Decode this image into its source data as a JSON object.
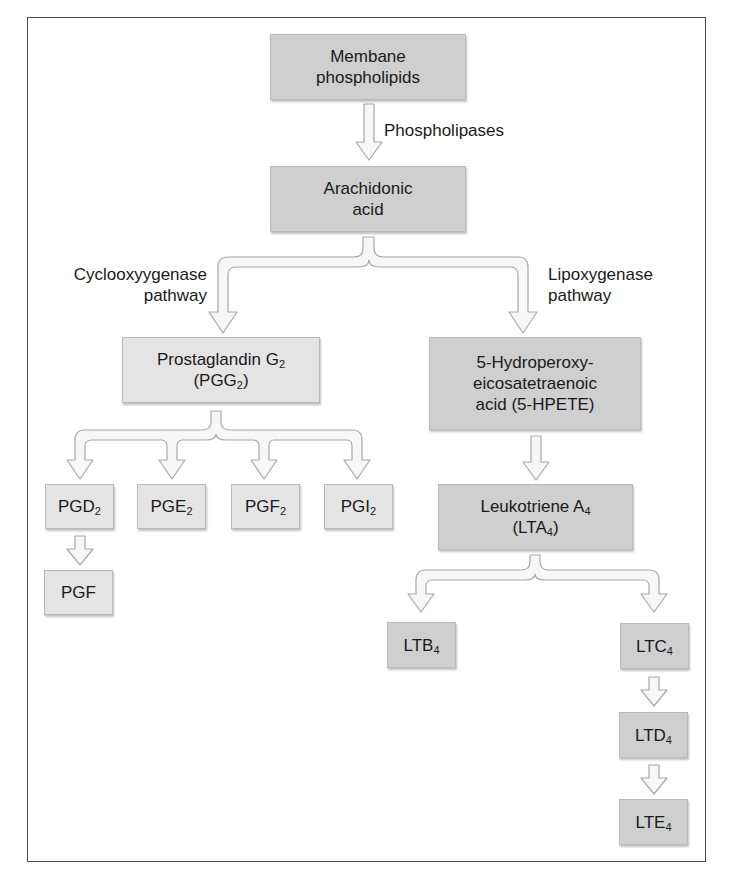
{
  "diagram": {
    "nodes": {
      "membrane": {
        "line1": "Membane",
        "line2": "phospholipids"
      },
      "arachidonic": {
        "line1": "Arachidonic",
        "line2": "acid"
      },
      "pgg2": {
        "line1_main": "Prostaglandin G",
        "line1_sub": "2",
        "line2_pre": "(PGG",
        "line2_sub": "2",
        "line2_post": ")"
      },
      "hpete": {
        "line1": "5-Hydroperoxy-",
        "line2": "eicosatetraenoic",
        "line3": "acid (5-HPETE)"
      },
      "pgd2": {
        "main": "PGD",
        "sub": "2"
      },
      "pge2": {
        "main": "PGE",
        "sub": "2"
      },
      "pgf2": {
        "main": "PGF",
        "sub": "2"
      },
      "pgi2": {
        "main": "PGI",
        "sub": "2"
      },
      "pgf": {
        "main": "PGF"
      },
      "lta4": {
        "line1_main": "Leukotriene A",
        "line1_sub": "4",
        "line2_pre": "(LTA",
        "line2_sub": "4",
        "line2_post": ")"
      },
      "ltb4": {
        "main": "LTB",
        "sub": "4"
      },
      "ltc4": {
        "main": "LTC",
        "sub": "4"
      },
      "ltd4": {
        "main": "LTD",
        "sub": "4"
      },
      "lte4": {
        "main": "LTE",
        "sub": "4"
      }
    },
    "edge_labels": {
      "phospholipases": "Phospholipases",
      "cox_line1": "Cyclooxyygenase",
      "cox_line2": "pathway",
      "lox_line1": "Lipoxygenase",
      "lox_line2": "pathway"
    },
    "colors": {
      "dark_box": "#cfcfcf",
      "light_box": "#e4e4e4",
      "arrow_fill": "#f7f7f7",
      "arrow_stroke": "#a8a8a8",
      "frame": "#4a4a4a"
    }
  }
}
